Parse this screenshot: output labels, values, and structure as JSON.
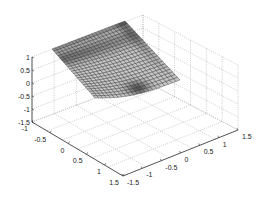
{
  "chart_data": {
    "type": "surface3d",
    "title": "",
    "xlabel": "",
    "ylabel": "",
    "zlabel": "",
    "x_ticks": [
      "-1.5",
      "-1",
      "-0.5",
      "0",
      "0.5",
      "1",
      "1.5"
    ],
    "y_ticks": [
      "-1",
      "-0.5",
      "0",
      "0.5",
      "1",
      "1.5"
    ],
    "z_ticks": [
      "-1.5",
      "-1",
      "-0.5",
      "0",
      "0.5",
      "1"
    ],
    "xlim": [
      -1.5,
      1.5
    ],
    "ylim": [
      -1,
      1.5
    ],
    "zlim": [
      -1.5,
      1
    ],
    "grid": true,
    "mesh": {
      "rows": 22,
      "cols": 22,
      "edge_color": "#222222",
      "face_color_light": "#d8d8d8",
      "face_color_dark": "#3a3a3a"
    },
    "surface_z_range": [
      -0.2,
      1.0
    ]
  },
  "axes": {
    "z_tick_labels": [
      "1",
      "0.5",
      "0",
      "-0.5",
      "-1",
      "-1.5"
    ],
    "left_axis_labels": [
      "-1",
      "-0.5",
      "0",
      "0.5",
      "1",
      "1.5"
    ],
    "right_axis_labels": [
      "-1.5",
      "-1",
      "-0.5",
      "0",
      "0.5",
      "1",
      "1.5"
    ]
  }
}
